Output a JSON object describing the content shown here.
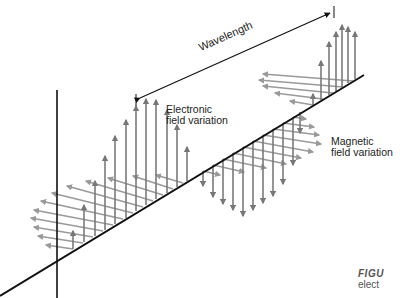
{
  "diagram": {
    "labels": {
      "wavelength": "Wavelength",
      "electric_line1": "Electronic",
      "electric_line2": "field variation",
      "magnetic_line1": "Magnetic",
      "magnetic_line2": "field variation"
    },
    "caption": {
      "title": "FIGU",
      "line1": "elect"
    },
    "colors": {
      "axis": "#111111",
      "vector": "#7a7a7a",
      "magnetic_vector": "#9a9a9a"
    }
  }
}
